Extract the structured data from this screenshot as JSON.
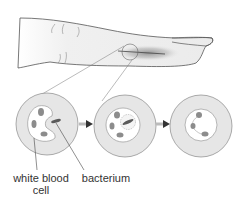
{
  "diagram": {
    "labels": {
      "white_blood_cell_line1": "white blood",
      "white_blood_cell_line2": "cell",
      "bacterium": "bacterium"
    },
    "stages": [
      {
        "name": "approach",
        "description": "white blood cell near bacterium"
      },
      {
        "name": "engulf",
        "description": "bacterium enclosed in vacuole"
      },
      {
        "name": "digest",
        "description": "bacterium destroyed"
      }
    ],
    "colors": {
      "outline": "#7a7a7a",
      "cell_fill": "#e6e6e6",
      "inner_fill": "#ffffff",
      "lobe": "#8c8c8c",
      "bacterium": "#5a5a5a",
      "arrow": "#3a3a3a",
      "skin": "#ececec",
      "wound": "#9a9a9a"
    }
  }
}
